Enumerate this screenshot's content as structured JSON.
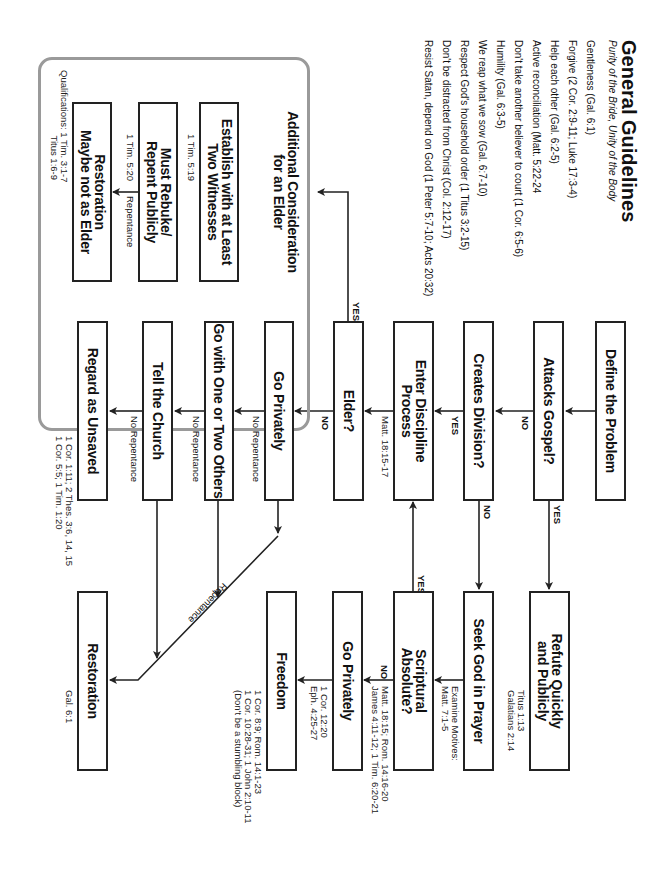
{
  "guidelines": {
    "title": "General Guidelines",
    "subtitle": "Purity of the Bride, Unity of the Body",
    "items": [
      "Gentleness (Gal. 6:1)",
      "Forgive (2 Cor. 2:9-11; Luke 17:3-4)",
      "Help each other (Gal. 6:2-5)",
      "Active reconciliation (Matt. 5:22-24",
      "Don't take another believer to court (1 Cor. 6:5-6)",
      "Humility (Gal. 6:3-5)",
      "We reap what we sow (Gal. 6:7-10)",
      "Respect God's household order (1 Titus 3:2-15)",
      "Don't be distracted from Christ (Col. 2:12-17)",
      "Resist Satan, depend on God (1 Peter 5:7-10; Acts 20:32)"
    ]
  },
  "elder_section": {
    "title_line1": "Additional Consideration",
    "title_line2": "for an Elder",
    "establish": {
      "line1": "Establish with at Least",
      "line2": "Two Witnesses",
      "ref": "1 Tim. 5:19"
    },
    "rebuke": {
      "line1": "Must Rebuke/",
      "line2": "Repent Publicly",
      "ref": "1 Tim. 5:20",
      "edge": "Repentance"
    },
    "restoration": {
      "line1": "Restoration",
      "line2": "Maybe not as Elder",
      "ref_line1": "Qualifications: 1 Tim. 3:1-7",
      "ref_line2": "Titus 1:6-9"
    }
  },
  "nodes": {
    "define": "Define the Problem",
    "attacks": "Attacks Gospel?",
    "division": "Creates Division?",
    "enter_line1": "Enter Discipline",
    "enter_line2": "Process",
    "enter_ref": "Matt. 18:15-17",
    "elder": "Elder?",
    "go_privately": "Go Privately",
    "go_with": "Go with One or Two Others",
    "tell": "Tell the Church",
    "regard": "Regard as Unsaved",
    "regard_ref_line1": "1 Cor. 1:11; 2 Thes. 3:6, 14, 15",
    "regard_ref_line2": "1 Cor. 5:5; 1 Tim. 1:20",
    "refute_line1": "Refute Quickly",
    "refute_line2": "and Publicly",
    "refute_ref_line1": "Titus 1:13",
    "refute_ref_line2": "Galatians 2:14",
    "seek": "Seek God in Prayer",
    "seek_ref_line1": "Examine Motives:",
    "seek_ref_line2": "Matt. 7:1-5",
    "scriptural_line1": "Scriptural",
    "scriptural_line2": "Absolute?",
    "scriptural_ref_line1": "Matt. 18:15; Rom. 14:16-20",
    "scriptural_ref_line2": "James 4:11-12; 1 Tim. 6:20-21",
    "go_privately2": "Go Privately",
    "go_privately2_ref_line1": "1 Cor. 12:20",
    "go_privately2_ref_line2": "Eph. 4:25-27",
    "freedom": "Freedom",
    "freedom_ref_line1": "1 Cor. 8:9; Rom. 14:1-23",
    "freedom_ref_line2": "1 Cor. 10:28-31; 1 John 2:10-11",
    "freedom_ref_line3": "(Don't be a stumbling block)",
    "restoration": "Restoration",
    "restoration_ref": "Gal. 6:1"
  },
  "edges": {
    "yes": "YES",
    "no": "NO",
    "no_repentance": "No Repentance",
    "repentance": "Repentance"
  },
  "colors": {
    "line": "#222222",
    "elder_frame": "#9a9a9a"
  }
}
